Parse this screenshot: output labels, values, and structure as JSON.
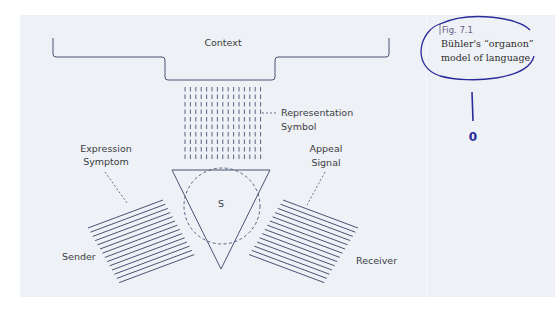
{
  "diagram": {
    "context_label": "Context",
    "representation_label": "Representation",
    "symbol_label": "Symbol",
    "expression_label": "Expression",
    "symptom_label": "Symptom",
    "appeal_label": "Appeal",
    "signal_label": "Signal",
    "sign_label": "S",
    "sender_label": "Sender",
    "receiver_label": "Receiver"
  },
  "caption": {
    "figure_number": "Fig. 7.1",
    "line1": "Bühler's “organon”",
    "line2": "model of language"
  },
  "annotation": {
    "handwritten_mark": "0"
  },
  "colors": {
    "panel_bg": "#eef1f5",
    "line": "#4a5275",
    "text": "#3a3d44",
    "ink": "#2a2a9a"
  }
}
